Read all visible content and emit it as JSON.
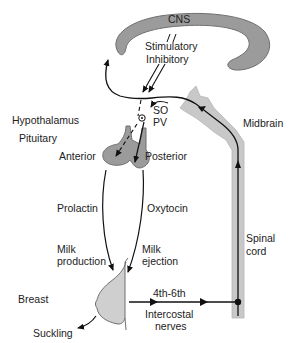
{
  "colors": {
    "structure_fill": "#9b9b9b",
    "structure_stroke": "#6f6f6f",
    "cord_fill": "#c8c8c8",
    "breast_fill": "#cfcfcf",
    "line": "#111111",
    "text": "#222222"
  },
  "labels": {
    "cns": "CNS",
    "stimulatory": "Stimulatory",
    "inhibitory": "Inhibitory",
    "hypothalamus": "Hypothalamus",
    "so": "SO",
    "pv": "PV",
    "pituitary": "Pituitary",
    "anterior": "Anterior",
    "posterior": "Posterior",
    "midbrain": "Midbrain",
    "prolactin": "Prolactin",
    "oxytocin": "Oxytocin",
    "milk_production_1": "Milk",
    "milk_production_2": "production",
    "milk_ejection_1": "Milk",
    "milk_ejection_2": "ejection",
    "spinal_cord_1": "Spinal",
    "spinal_cord_2": "cord",
    "breast": "Breast",
    "nerves_level": "4th-6th",
    "intercostal_1": "Intercostal",
    "intercostal_2": "nerves",
    "suckling": "Suckling"
  }
}
